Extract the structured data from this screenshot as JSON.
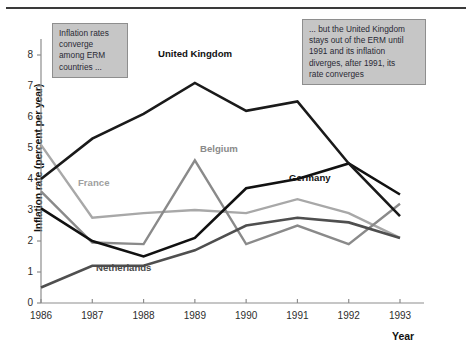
{
  "chart_data": {
    "type": "line",
    "title": "",
    "xlabel": "Year",
    "ylabel": "Inflation rate (percent per year)",
    "x": [
      1986,
      1987,
      1988,
      1989,
      1990,
      1991,
      1992,
      1993
    ],
    "xtick_labels": [
      "1986",
      "1987",
      "1988",
      "1989",
      "1990",
      "1991",
      "1992",
      "1993"
    ],
    "ytick_labels": [
      "0",
      "1",
      "2",
      "3",
      "4",
      "5",
      "6",
      "7",
      "8"
    ],
    "ylim": [
      0,
      8.6
    ],
    "xlim": [
      1986,
      1993
    ],
    "grid": false,
    "legend": "inline-labels",
    "series": [
      {
        "name": "United Kingdom",
        "color": "#1a1a1a",
        "width": 2.6,
        "values": [
          4.0,
          5.3,
          6.1,
          7.1,
          6.2,
          6.5,
          4.5,
          2.8
        ]
      },
      {
        "name": "Germany",
        "color": "#111111",
        "width": 2.6,
        "values": [
          3.05,
          2.0,
          1.5,
          2.1,
          3.7,
          4.0,
          4.5,
          3.5
        ]
      },
      {
        "name": "France",
        "color": "#a8a8a8",
        "width": 2.4,
        "values": [
          5.1,
          2.75,
          2.9,
          3.0,
          2.9,
          3.35,
          2.9,
          2.1
        ]
      },
      {
        "name": "Belgium",
        "color": "#8a8a8a",
        "width": 2.4,
        "values": [
          3.6,
          1.95,
          1.9,
          4.6,
          1.9,
          2.5,
          1.9,
          3.2
        ]
      },
      {
        "name": "Netherlands",
        "color": "#4f4f4f",
        "width": 2.6,
        "values": [
          0.5,
          1.2,
          1.2,
          1.7,
          2.5,
          2.75,
          2.6,
          2.1
        ]
      }
    ],
    "series_label_positions": [
      {
        "name": "United Kingdom",
        "left": 158,
        "top": 48,
        "color": "#111111"
      },
      {
        "name": "Germany",
        "left": 289,
        "top": 172,
        "color": "#111111"
      },
      {
        "name": "France",
        "left": 78,
        "top": 177,
        "color": "#a0a0a0"
      },
      {
        "name": "Belgium",
        "left": 200,
        "top": 143,
        "color": "#8a8a8a"
      },
      {
        "name": "Netherlands",
        "left": 96,
        "top": 262,
        "color": "#4a4a4a"
      }
    ],
    "annotations": [
      {
        "id": "left",
        "lines": [
          "Inflation rates",
          "converge",
          "among ERM",
          "countries ..."
        ]
      },
      {
        "id": "right",
        "lines": [
          "... but the United Kingdom",
          "stays out of the ERM until",
          "1991 and its inflation",
          "diverges, after 1991, its",
          "rate converges"
        ]
      }
    ]
  }
}
